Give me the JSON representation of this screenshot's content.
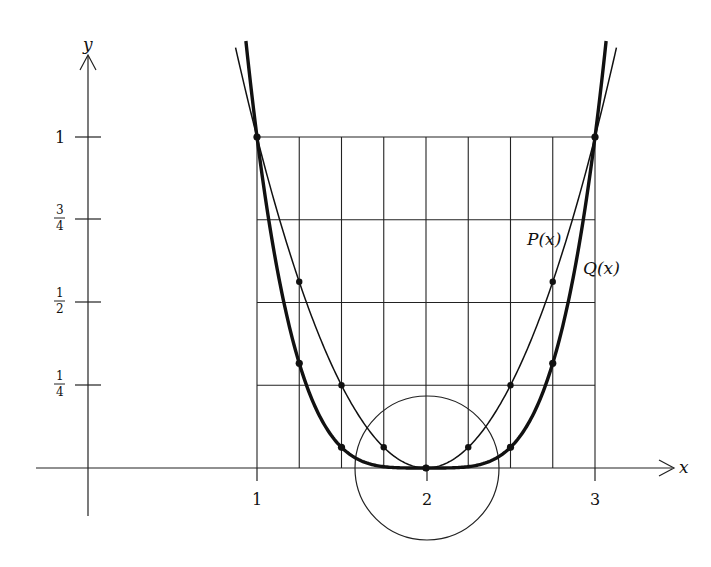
{
  "chart_data": {
    "type": "line",
    "title": "",
    "xlabel": "x",
    "ylabel": "y",
    "xlim": [
      -0.3,
      3.35
    ],
    "ylim": [
      -0.22,
      1.3
    ],
    "grid": "partial (x from 1 to 3 step 1/4, y from 0 to 1 step 1/4)",
    "x_ticks": [
      {
        "value": 1,
        "label": "1"
      },
      {
        "value": 2,
        "label": "2"
      },
      {
        "value": 3,
        "label": "3"
      }
    ],
    "y_ticks": [
      {
        "value": 1,
        "label": "1"
      },
      {
        "value": 0.75,
        "num": "3",
        "den": "4"
      },
      {
        "value": 0.5,
        "num": "1",
        "den": "2"
      },
      {
        "value": 0.25,
        "num": "1",
        "den": "4"
      }
    ],
    "series": [
      {
        "name": "P(x)",
        "formula": "(x-2)^2",
        "style": "thin",
        "x": [
          1,
          1.25,
          1.5,
          1.75,
          2,
          2.25,
          2.5,
          2.75,
          3
        ],
        "values": [
          1,
          0.5625,
          0.25,
          0.0625,
          0,
          0.0625,
          0.25,
          0.5625,
          1
        ]
      },
      {
        "name": "Q(x)",
        "formula": "(x-2)^4",
        "style": "thick",
        "x": [
          1,
          1.25,
          1.5,
          1.75,
          2,
          2.25,
          2.5,
          2.75,
          3
        ],
        "values": [
          1,
          0.3164,
          0.0625,
          0.0039,
          0,
          0.0039,
          0.0625,
          0.3164,
          1
        ]
      }
    ],
    "annotations": [
      {
        "type": "circle",
        "center": [
          2,
          0
        ],
        "radius_px": 72,
        "note": "neighborhood of the minimum at x = 2"
      },
      {
        "type": "label",
        "text": "P(x)",
        "near": [
          2.75,
          0.75
        ]
      },
      {
        "type": "label",
        "text": "Q(x)",
        "near": [
          2.95,
          0.6
        ]
      }
    ],
    "legend": "none (curves labeled inline)"
  },
  "labels": {
    "x_axis": "x",
    "y_axis": "y",
    "p_curve": "P(x)",
    "q_curve": "Q(x)",
    "x_tick_1": "1",
    "x_tick_2": "2",
    "x_tick_3": "3",
    "y_tick_1": "1",
    "y_tick_34_num": "3",
    "y_tick_34_den": "4",
    "y_tick_12_num": "1",
    "y_tick_12_den": "2",
    "y_tick_14_num": "1",
    "y_tick_14_den": "4"
  }
}
